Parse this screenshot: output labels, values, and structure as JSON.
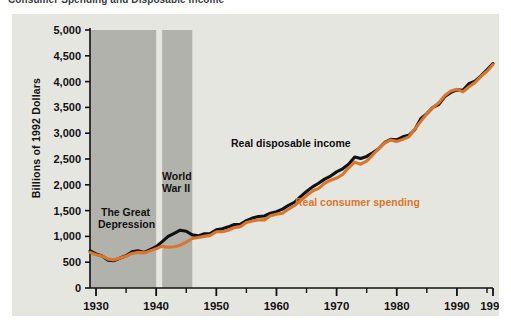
{
  "figure": {
    "title": "Consumer Spending and Disposable Income",
    "title_bullet": "square-bullet"
  },
  "annotations": {
    "great_depression": {
      "line1": "The Great",
      "line2": "Depression"
    },
    "world_war_ii": {
      "line1": "World",
      "line2": "War II"
    }
  },
  "colors": {
    "panel_background": "#e6e6e1",
    "band_shade": "#b2b2ac",
    "disposable_income": "#111111",
    "consumer_spending": "#d9762b",
    "axis": "#111111",
    "page_background": "#ffffff"
  },
  "chart_data": {
    "type": "line",
    "title": "Consumer Spending and Disposable Income",
    "xlabel": "",
    "ylabel": "Billions of 1992 Dollars",
    "xlim": [
      1929,
      1996
    ],
    "ylim": [
      0,
      5000
    ],
    "grid": false,
    "legend": "inline-labels",
    "ytick_labels": [
      "0",
      "500",
      "1,000",
      "1,500",
      "2,000",
      "2,500",
      "3,000",
      "3,500",
      "4,000",
      "4,500",
      "5,000"
    ],
    "ytick_values": [
      0,
      500,
      1000,
      1500,
      2000,
      2500,
      3000,
      3500,
      4000,
      4500,
      5000
    ],
    "xtick_labels": [
      "1930",
      "1940",
      "1950",
      "1960",
      "1970",
      "1980",
      "1990",
      "1996"
    ],
    "xtick_values": [
      1930,
      1940,
      1950,
      1960,
      1970,
      1980,
      1990,
      1996
    ],
    "xtick_minor_values": [
      1935,
      1945,
      1955,
      1965,
      1975,
      1985,
      1995
    ],
    "shaded_bands": [
      {
        "name": "The Great Depression",
        "x0": 1929,
        "x1": 1940
      },
      {
        "name": "World War II",
        "x0": 1941,
        "x1": 1946
      }
    ],
    "x": [
      1929,
      1930,
      1931,
      1932,
      1933,
      1934,
      1935,
      1936,
      1937,
      1938,
      1939,
      1940,
      1941,
      1942,
      1943,
      1944,
      1945,
      1946,
      1947,
      1948,
      1949,
      1950,
      1951,
      1952,
      1953,
      1954,
      1955,
      1956,
      1957,
      1958,
      1959,
      1960,
      1961,
      1962,
      1963,
      1964,
      1965,
      1966,
      1967,
      1968,
      1969,
      1970,
      1971,
      1972,
      1973,
      1974,
      1975,
      1976,
      1977,
      1978,
      1979,
      1980,
      1981,
      1982,
      1983,
      1984,
      1985,
      1986,
      1987,
      1988,
      1989,
      1990,
      1991,
      1992,
      1993,
      1994,
      1995,
      1996
    ],
    "series": [
      {
        "name": "Real disposable income",
        "color": "#111111",
        "values": [
          720,
          660,
          620,
          540,
          530,
          580,
          625,
          700,
          720,
          690,
          745,
          800,
          900,
          1000,
          1060,
          1120,
          1100,
          1030,
          1010,
          1050,
          1055,
          1130,
          1150,
          1185,
          1230,
          1235,
          1305,
          1355,
          1385,
          1395,
          1450,
          1480,
          1530,
          1600,
          1660,
          1770,
          1870,
          1960,
          2030,
          2110,
          2170,
          2250,
          2310,
          2400,
          2540,
          2510,
          2550,
          2620,
          2700,
          2820,
          2880,
          2870,
          2930,
          2960,
          3070,
          3280,
          3380,
          3500,
          3560,
          3710,
          3790,
          3840,
          3830,
          3960,
          4010,
          4110,
          4230,
          4350
        ],
        "end_label": "Real disposable income"
      },
      {
        "name": "Real consumer spending",
        "color": "#d9762b",
        "values": [
          690,
          645,
          620,
          560,
          545,
          580,
          615,
          670,
          690,
          680,
          720,
          760,
          810,
          790,
          800,
          830,
          890,
          960,
          980,
          1000,
          1020,
          1090,
          1090,
          1120,
          1170,
          1190,
          1270,
          1300,
          1320,
          1320,
          1400,
          1430,
          1450,
          1530,
          1600,
          1690,
          1790,
          1880,
          1930,
          2030,
          2090,
          2130,
          2200,
          2330,
          2440,
          2400,
          2460,
          2580,
          2700,
          2810,
          2870,
          2840,
          2880,
          2930,
          3080,
          3230,
          3380,
          3500,
          3590,
          3730,
          3820,
          3850,
          3800,
          3900,
          3980,
          4100,
          4200,
          4330
        ],
        "end_label": "Real consumer spending"
      }
    ]
  }
}
